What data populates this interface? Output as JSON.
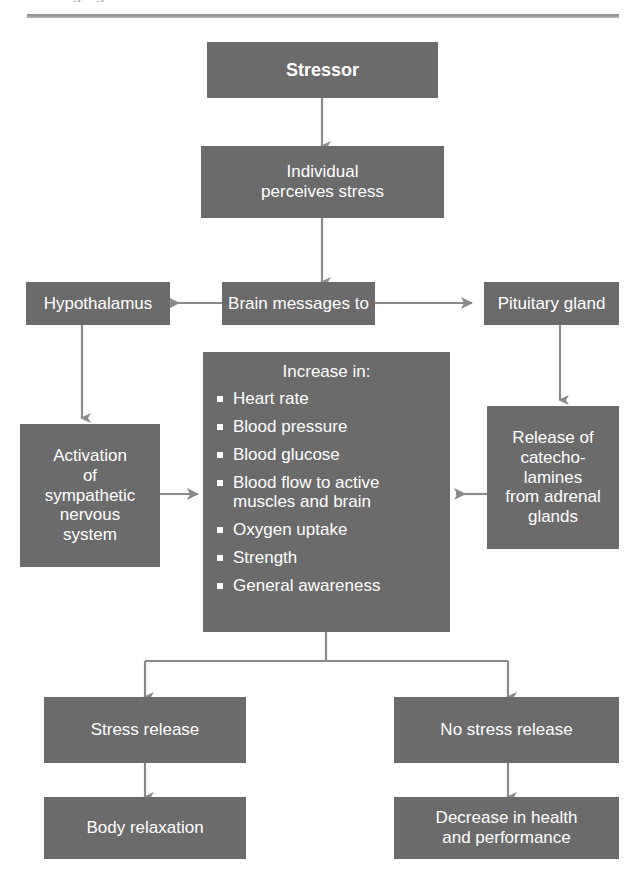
{
  "page": {
    "clipped_heading": "Changing the Stressor",
    "divider": "horizontal-rule"
  },
  "flowchart": {
    "title": "Stress response flow chart",
    "colors": {
      "box_fill": "#6b6b6b",
      "box_text": "#ffffff",
      "connector": "#8a8a8a",
      "page_background": "#ffffff"
    },
    "nodes": {
      "stressor": {
        "label": "Stressor"
      },
      "perceives": {
        "line1": "Individual",
        "line2": "perceives stress"
      },
      "hypothalamus": {
        "label": "Hypothalamus"
      },
      "brain_messages": {
        "label": "Brain messages to"
      },
      "pituitary": {
        "label": "Pituitary gland"
      },
      "activation": {
        "line1": "Activation",
        "line2": "of",
        "line3": "sympathetic",
        "line4": "nervous",
        "line5": "system"
      },
      "release": {
        "line1": "Release of",
        "line2": "catecho-",
        "line3": "lamines",
        "line4": "from adrenal",
        "line5": "glands"
      },
      "increase": {
        "heading": "Increase in:",
        "items": [
          {
            "text": "Heart rate"
          },
          {
            "text": "Blood pressure"
          },
          {
            "text": "Blood glucose"
          },
          {
            "text": "Blood flow to active",
            "text2": "muscles and brain"
          },
          {
            "text": "Oxygen uptake"
          },
          {
            "text": "Strength"
          },
          {
            "text": "General awareness"
          }
        ]
      },
      "stress_release": {
        "label": "Stress release"
      },
      "no_stress_release": {
        "label": "No stress release"
      },
      "body_relaxation": {
        "label": "Body relaxation"
      },
      "decrease": {
        "line1": "Decrease in health",
        "line2": "and performance"
      }
    },
    "edges": [
      {
        "from": "stressor",
        "to": "perceives",
        "direction": "down"
      },
      {
        "from": "perceives",
        "to": "brain_messages",
        "direction": "down"
      },
      {
        "from": "brain_messages",
        "to": "hypothalamus",
        "direction": "left"
      },
      {
        "from": "brain_messages",
        "to": "pituitary",
        "direction": "right"
      },
      {
        "from": "hypothalamus",
        "to": "activation",
        "direction": "down"
      },
      {
        "from": "pituitary",
        "to": "release",
        "direction": "down"
      },
      {
        "from": "activation",
        "to": "increase",
        "direction": "right"
      },
      {
        "from": "release",
        "to": "increase",
        "direction": "left"
      },
      {
        "from": "increase",
        "to": "stress_release",
        "direction": "down-branch-left"
      },
      {
        "from": "increase",
        "to": "no_stress_release",
        "direction": "down-branch-right"
      },
      {
        "from": "stress_release",
        "to": "body_relaxation",
        "direction": "down"
      },
      {
        "from": "no_stress_release",
        "to": "decrease",
        "direction": "down"
      }
    ]
  }
}
